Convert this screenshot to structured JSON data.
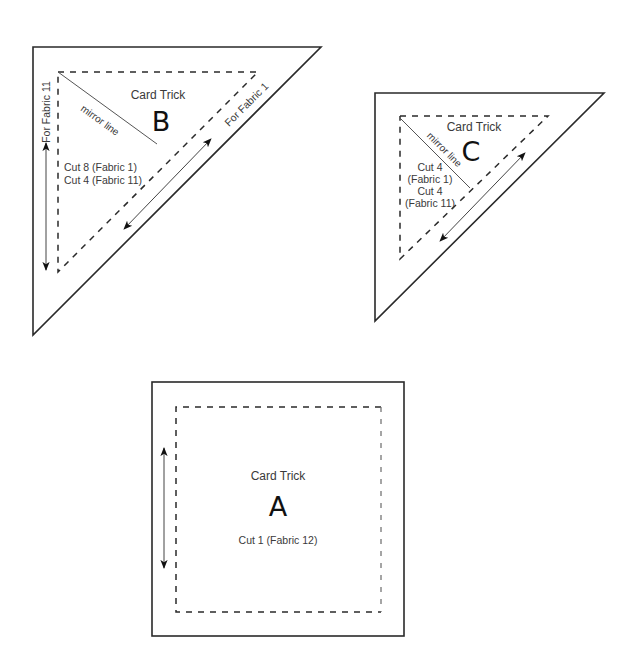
{
  "colors": {
    "background": "#ffffff",
    "line": "#2a2a2a",
    "text": "#3a3a3a",
    "letter": "#111111"
  },
  "pieces": {
    "B": {
      "title": "Card Trick",
      "letter": "B",
      "shape": "right-triangle",
      "outer": [
        [
          33,
          47
        ],
        [
          321,
          47
        ],
        [
          33,
          335
        ]
      ],
      "seam": [
        [
          58,
          72
        ],
        [
          258,
          72
        ],
        [
          58,
          272
        ]
      ],
      "mirror_label": "mirror line",
      "mirror_line": [
        [
          58,
          72
        ],
        [
          157,
          144
        ]
      ],
      "cut_lines": [
        "Cut 8 (Fabric 1)",
        "Cut 4 (Fabric 11)"
      ],
      "side_labels": {
        "left": "For Fabric 11",
        "hypotenuse": "For Fabric 1"
      },
      "grain_arrows": [
        {
          "from": [
            46,
            143
          ],
          "to": [
            46,
            270
          ]
        },
        {
          "from": [
            124,
            229
          ],
          "to": [
            211,
            139
          ]
        }
      ]
    },
    "C": {
      "title": "Card Trick",
      "letter": "C",
      "shape": "right-triangle",
      "outer": [
        [
          375,
          93
        ],
        [
          604,
          93
        ],
        [
          375,
          321
        ]
      ],
      "seam": [
        [
          400,
          116
        ],
        [
          548,
          116
        ],
        [
          400,
          259
        ]
      ],
      "mirror_label": "mirror line",
      "mirror_line": [
        [
          400,
          118
        ],
        [
          470,
          188
        ]
      ],
      "cut_lines": [
        "Cut 4",
        "(Fabric 1)",
        "Cut 4",
        "(Fabric 11)"
      ],
      "grain_arrows": [
        {
          "from": [
            440,
            241
          ],
          "to": [
            525,
            153
          ]
        }
      ]
    },
    "A": {
      "title": "Card Trick",
      "letter": "A",
      "shape": "square",
      "outer": {
        "x": 152,
        "y": 382,
        "w": 252,
        "h": 254
      },
      "seam": {
        "x": 176,
        "y": 407,
        "w": 205,
        "h": 205
      },
      "cut_lines": [
        "Cut 1 (Fabric 12)"
      ],
      "grain_arrows": [
        {
          "from": [
            164,
            448
          ],
          "to": [
            164,
            568
          ]
        }
      ]
    }
  }
}
